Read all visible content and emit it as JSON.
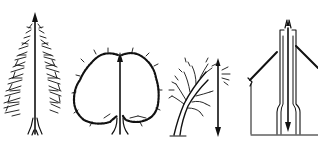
{
  "illustration": {
    "background": "#ffffff",
    "ink_color": "#111111",
    "figures": [
      {
        "name": "conifer-tree",
        "arrow": "up"
      },
      {
        "name": "rounded-deciduous-tree",
        "arrow": "up"
      },
      {
        "name": "windswept-tree",
        "arrow": "down"
      },
      {
        "name": "house-with-chimney",
        "arrow": "up-and-down"
      }
    ]
  }
}
